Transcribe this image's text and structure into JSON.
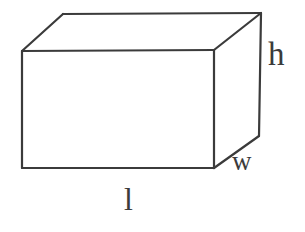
{
  "figure": {
    "shape": "rectangular-prism",
    "stroke_color": "#3b3b3b",
    "background_color": "#ffffff",
    "fill_color": "none",
    "stroke_width": 2.2,
    "labels": {
      "height": "h",
      "width": "w",
      "length": "l"
    },
    "geometry": {
      "front_top_left": [
        22,
        51
      ],
      "front_top_right": [
        214,
        50
      ],
      "front_bottom_right": [
        214,
        168
      ],
      "front_bottom_left": [
        22,
        168
      ],
      "back_top_left": [
        63,
        14
      ],
      "back_top_right": [
        261,
        13
      ],
      "back_bottom_right": [
        259,
        136
      ]
    },
    "label_positions": {
      "height": [
        277,
        55
      ],
      "width": [
        245,
        163
      ],
      "length": [
        130,
        200
      ]
    }
  }
}
